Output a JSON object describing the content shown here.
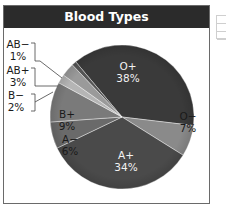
{
  "chart_data": {
    "type": "pie",
    "title": "Blood Types",
    "categories": [
      "O+",
      "O−",
      "A+",
      "A−",
      "B+",
      "B−",
      "AB+",
      "AB−"
    ],
    "values": [
      38,
      7,
      34,
      6,
      9,
      2,
      3,
      1
    ],
    "labels": [
      "38%",
      "7%",
      "34%",
      "6%",
      "9%",
      "2%",
      "3%",
      "1%"
    ],
    "colors": [
      "#3a3a3a",
      "#8a8a8a",
      "#4a4a4a",
      "#6a6a6a",
      "#7a7a7a",
      "#b5b5b5",
      "#9a9a9a",
      "#555555"
    ],
    "unit": "%",
    "legend": "none (callout labels for AB−, AB+, B−)"
  },
  "title": "Blood Types",
  "slices": [
    {
      "name": "O+",
      "pct": "38%"
    },
    {
      "name": "O−",
      "pct": "7%"
    },
    {
      "name": "A+",
      "pct": "34%"
    },
    {
      "name": "A−",
      "pct": "6%"
    },
    {
      "name": "B+",
      "pct": "9%"
    },
    {
      "name": "B−",
      "pct": "2%"
    },
    {
      "name": "AB+",
      "pct": "3%"
    },
    {
      "name": "AB−",
      "pct": "1%"
    }
  ]
}
